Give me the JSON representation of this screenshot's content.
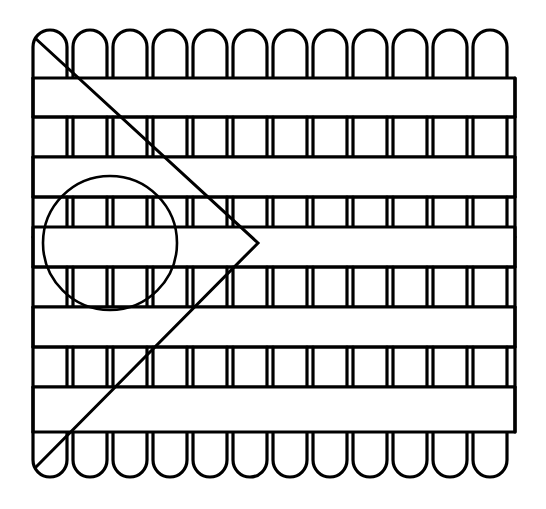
{
  "figure": {
    "kind": "line-art",
    "canvas": {
      "width": 546,
      "height": 509,
      "background": "#ffffff"
    },
    "stroke_color": "#000000",
    "outline_stroke_width": 3.2,
    "annotation_stroke_width": 3.0,
    "circle_stroke_width": 2.6
  },
  "fence": {
    "left": 33,
    "right": 515,
    "top": 30,
    "bottom": 477,
    "picket_count": 12,
    "picket_width": 34,
    "picket_gap": 6,
    "picket_pitch": 40,
    "picket_cap_radius": 17,
    "picket_top_cap_y": 78,
    "picket_bottom_cap_y": 432,
    "band_count": 9,
    "band_edges_y": [
      78,
      118,
      157,
      197,
      227,
      267,
      307,
      347,
      387,
      432
    ],
    "bands": [
      {
        "index": 0,
        "y": 78,
        "height": 39,
        "weave": "over",
        "label": "band-1-over"
      },
      {
        "index": 1,
        "y": 117,
        "height": 40,
        "weave": "under",
        "label": "band-2-under"
      },
      {
        "index": 2,
        "y": 157,
        "height": 40,
        "weave": "over",
        "label": "band-3-over"
      },
      {
        "index": 3,
        "y": 197,
        "height": 40,
        "weave": "under",
        "label": "band-4-under"
      },
      {
        "index": 4,
        "y": 227,
        "height": 40,
        "weave": "over",
        "label": "band-5-over"
      },
      {
        "index": 5,
        "y": 267,
        "height": 40,
        "weave": "under",
        "label": "band-6-under"
      },
      {
        "index": 6,
        "y": 307,
        "height": 40,
        "weave": "over",
        "label": "band-7-over"
      },
      {
        "index": 7,
        "y": 347,
        "height": 40,
        "weave": "under",
        "label": "band-8-under"
      },
      {
        "index": 8,
        "y": 387,
        "height": 45,
        "weave": "over",
        "label": "band-9-over"
      }
    ]
  },
  "annotations": {
    "circle": {
      "name": "circle-annotation",
      "center_x": 110,
      "center_y": 243,
      "radius": 67
    },
    "zigzag": {
      "name": "zigzag-annotation",
      "description": "Diagonal from upper-left to a rightward point, then back down to lower-left",
      "points": [
        {
          "x": 35,
          "y": 38
        },
        {
          "x": 258,
          "y": 243
        },
        {
          "x": 35,
          "y": 468
        }
      ]
    }
  }
}
